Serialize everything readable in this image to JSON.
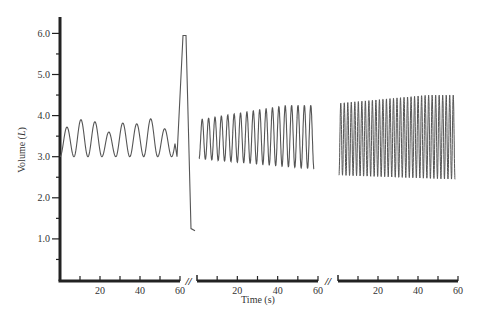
{
  "chart_data": {
    "type": "line",
    "title": "",
    "xlabel": "Time (s)",
    "ylabel": "Volume (L)",
    "ylabel_parts": {
      "main": "Volume (",
      "italic": "L",
      "end": ")"
    },
    "ylim": [
      0,
      6.5
    ],
    "yticks": [
      1.0,
      2.0,
      3.0,
      4.0,
      5.0,
      6.0
    ],
    "ytick_labels": [
      "1.0",
      "2.0",
      "3.0",
      "4.0",
      "5.0",
      "6.0"
    ],
    "ytick_minor": [
      0.5,
      1.5,
      2.5,
      3.5,
      4.5,
      5.5
    ],
    "grid": false,
    "legend": null,
    "axis_break_marker": "//",
    "segments": [
      {
        "name": "segment-1",
        "xlim": [
          0,
          60
        ],
        "xticks": [
          20,
          40,
          60
        ],
        "xtick_labels": [
          "20",
          "40",
          "60"
        ],
        "xtick_minor": [
          10,
          30,
          50
        ],
        "description": "Quiet breathing then maximal inspiration and forced expiration",
        "x": [
          0,
          2.5,
          5,
          7.5,
          10,
          12.5,
          15,
          17.5,
          20,
          22.5,
          25,
          27.5,
          30,
          32.5,
          35,
          37.5,
          40,
          42.5,
          45,
          47.5,
          50,
          52.5,
          55,
          57.5,
          60,
          62,
          63,
          64,
          66
        ],
        "values": [
          3.0,
          3.72,
          3.0,
          3.9,
          3.0,
          3.85,
          3.0,
          3.6,
          3.0,
          3.82,
          3.0,
          3.8,
          3.0,
          3.92,
          3.0,
          3.68,
          3.0,
          3.0,
          3.0,
          3.0,
          3.0,
          3.0,
          3.0,
          3.0,
          3.0,
          5.95,
          5.95,
          1.25,
          1.2
        ],
        "peaks_L": [
          3.72,
          3.9,
          3.85,
          3.6,
          3.82,
          3.8,
          3.92,
          3.68
        ],
        "max_inspiration_L": 5.95,
        "forced_expiration_end_L": 1.2
      },
      {
        "name": "segment-2",
        "xlim": [
          0,
          60
        ],
        "xticks": [
          20,
          40,
          60
        ],
        "xtick_labels": [
          "20",
          "40",
          "60"
        ],
        "xtick_minor": [
          10,
          30,
          50
        ],
        "description": "Increased tidal breathing (~18 breaths/min)",
        "cycles": 18,
        "trough_L": [
          2.95,
          2.7
        ],
        "peak_L": [
          3.9,
          4.25
        ]
      },
      {
        "name": "segment-3",
        "xlim": [
          0,
          60
        ],
        "xticks": [
          20,
          40,
          60
        ],
        "xtick_labels": [
          "20",
          "40",
          "60"
        ],
        "xtick_minor": [
          10,
          30,
          50
        ],
        "description": "Rapid deep breathing (~33 breaths/min)",
        "cycles": 33,
        "trough_L": [
          2.55,
          2.45
        ],
        "peak_L": [
          4.3,
          4.5
        ]
      }
    ]
  },
  "colors": {
    "axis": "#222222",
    "trace": "#555555",
    "text": "#333333",
    "background": "#ffffff"
  }
}
